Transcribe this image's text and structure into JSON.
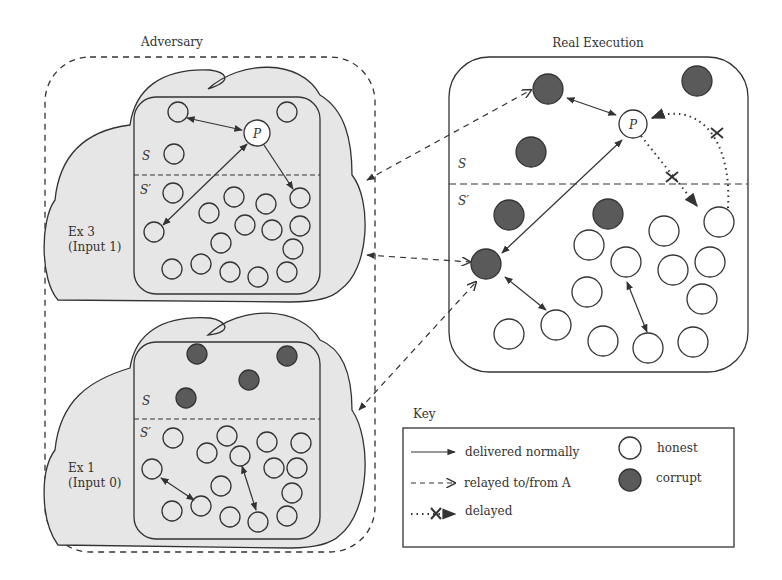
{
  "titles": {
    "adversary": "Adversary",
    "real": "Real Execution",
    "key": "Key"
  },
  "ex3": {
    "line1": "Ex 3",
    "line2": "(Input 1)",
    "s": "S",
    "sp": "S′",
    "p": "P"
  },
  "ex1": {
    "line1": "Ex 1",
    "line2": "(Input 0)",
    "s": "S",
    "sp": "S′"
  },
  "real": {
    "s": "S",
    "sp": "S′",
    "p": "P"
  },
  "key": {
    "delivered": "delivered normally",
    "relayed": "relayed to/from A",
    "delayed": "delayed",
    "honest": "honest",
    "corrupt": "corrupt"
  },
  "colors": {
    "cloud": "#e6e6e6",
    "corrupt": "#5a5a5a",
    "stroke": "#333333"
  },
  "nodes": {
    "ex3_honest": [
      [
        178,
        112
      ],
      [
        287,
        112
      ],
      [
        174,
        154
      ],
      [
        173,
        193
      ],
      [
        154,
        232
      ],
      [
        209,
        213
      ],
      [
        234,
        197
      ],
      [
        266,
        204
      ],
      [
        245,
        225
      ],
      [
        272,
        230
      ],
      [
        300,
        226
      ],
      [
        300,
        198
      ],
      [
        221,
        243
      ],
      [
        293,
        249
      ],
      [
        172,
        269
      ],
      [
        201,
        264
      ],
      [
        230,
        272
      ],
      [
        258,
        277
      ],
      [
        287,
        272
      ]
    ],
    "ex1_corrupt": [
      [
        197,
        354
      ],
      [
        287,
        356
      ],
      [
        249,
        380
      ],
      [
        186,
        398
      ]
    ],
    "ex1_honest": [
      [
        173,
        438
      ],
      [
        227,
        436
      ],
      [
        267,
        442
      ],
      [
        301,
        443
      ],
      [
        207,
        453
      ],
      [
        240,
        456
      ],
      [
        152,
        469
      ],
      [
        274,
        468
      ],
      [
        297,
        468
      ],
      [
        221,
        486
      ],
      [
        292,
        493
      ],
      [
        172,
        511
      ],
      [
        201,
        506
      ],
      [
        230,
        517
      ],
      [
        258,
        522
      ],
      [
        287,
        516
      ]
    ],
    "real_corrupt": [
      [
        548,
        89
      ],
      [
        697,
        81
      ],
      [
        531,
        152
      ],
      [
        509,
        215
      ],
      [
        608,
        214
      ],
      [
        486,
        264
      ]
    ],
    "real_honest": [
      [
        719,
        222
      ],
      [
        664,
        231
      ],
      [
        589,
        245
      ],
      [
        626,
        262
      ],
      [
        673,
        270
      ],
      [
        710,
        262
      ],
      [
        587,
        292
      ],
      [
        702,
        299
      ],
      [
        556,
        325
      ],
      [
        509,
        334
      ],
      [
        603,
        341
      ],
      [
        648,
        348
      ],
      [
        693,
        342
      ]
    ]
  }
}
